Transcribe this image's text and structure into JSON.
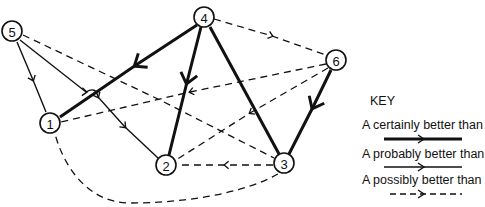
{
  "diagram": {
    "type": "directed-graph",
    "nodes": [
      {
        "id": "1",
        "label": "1",
        "x": 50,
        "y": 123
      },
      {
        "id": "2",
        "label": "2",
        "x": 166,
        "y": 165
      },
      {
        "id": "3",
        "label": "3",
        "x": 284,
        "y": 163
      },
      {
        "id": "4",
        "label": "4",
        "x": 204,
        "y": 17
      },
      {
        "id": "5",
        "label": "5",
        "x": 12,
        "y": 31
      },
      {
        "id": "6",
        "label": "6",
        "x": 336,
        "y": 60
      }
    ],
    "edges": [
      {
        "from": "4",
        "to": "1",
        "relation": "certainly"
      },
      {
        "from": "4",
        "to": "2",
        "relation": "certainly"
      },
      {
        "from": "4",
        "to": "3",
        "relation": "certainly"
      },
      {
        "from": "6",
        "to": "3",
        "relation": "certainly"
      },
      {
        "from": "5",
        "to": "1",
        "relation": "probably"
      },
      {
        "from": "5",
        "to": "2",
        "relation": "probably"
      },
      {
        "from": "4",
        "to": "6",
        "relation": "possibly"
      },
      {
        "from": "6",
        "to": "1",
        "relation": "possibly"
      },
      {
        "from": "6",
        "to": "2",
        "relation": "possibly"
      },
      {
        "from": "5",
        "to": "3",
        "relation": "possibly"
      },
      {
        "from": "3",
        "to": "2",
        "relation": "possibly"
      },
      {
        "from": "3",
        "to": "1",
        "relation": "possibly"
      }
    ]
  },
  "key": {
    "title": "KEY",
    "items": [
      {
        "label": "A certainly better than B",
        "style": "thick-solid"
      },
      {
        "label": "A probably better than B",
        "style": "thin-solid"
      },
      {
        "label": "A possibly better than B",
        "style": "dashed"
      }
    ]
  },
  "colors": {
    "ink": "#111111",
    "background": "#ffffff"
  }
}
